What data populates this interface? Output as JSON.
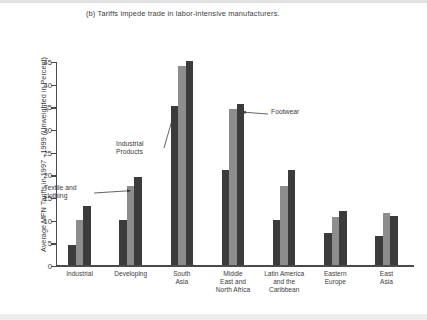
{
  "chart_data": {
    "type": "bar",
    "title": "(b) Tariffs impede trade in labor-intensive manufacturers.",
    "xlabel": "",
    "ylabel": "Average MFN Tariffs in 1997 - 1999 (Unweighted in Percent)",
    "ylim": [
      0,
      45
    ],
    "ytick_step": 5,
    "yticks": [
      0,
      5,
      10,
      15,
      20,
      25,
      30,
      35,
      40,
      45
    ],
    "grid": false,
    "legend_position": "none",
    "categories": [
      "Industrial",
      "Developing",
      "South\nAsia",
      "Middle\nEast and\nNorth Africa",
      "Latin America\nand the\nCaribbean",
      "Eastern\nEurope",
      "East\nAsia"
    ],
    "series": [
      {
        "name": "Industrial Products",
        "color": "#3b3b3b",
        "values": [
          4.5,
          10.0,
          35.0,
          21.0,
          10.0,
          7.0,
          6.5
        ]
      },
      {
        "name": "Textile and clothing",
        "color": "#8d8d8d",
        "values": [
          10.0,
          17.5,
          44.0,
          34.5,
          17.5,
          10.5,
          11.5
        ]
      },
      {
        "name": "Footwear",
        "color": "#3b3b3b",
        "values": [
          13.0,
          19.5,
          45.0,
          35.5,
          21.0,
          12.0,
          10.8
        ]
      }
    ],
    "annotations": [
      {
        "id": "industrial-products",
        "label": "Industrial\nProducts",
        "points_to": "South Asia / Industrial Products"
      },
      {
        "id": "textile-and-clothing",
        "label": "Textile and\nclothing",
        "points_to": "Developing / Textile and clothing"
      },
      {
        "id": "footwear",
        "label": "Footwear",
        "points_to": "Middle East and North Africa / Footwear"
      }
    ]
  }
}
